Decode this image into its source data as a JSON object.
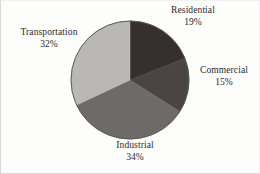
{
  "chart_data": {
    "type": "pie",
    "title": "",
    "subtitle": "",
    "xlabel": "",
    "ylabel": "",
    "legend_position": "none",
    "grid": false,
    "start_angle_deg": 0,
    "direction": "clockwise",
    "categories": [
      "Residential",
      "Commercial",
      "Industrial",
      "Transportation"
    ],
    "values": [
      19,
      15,
      34,
      32
    ],
    "value_unit": "%",
    "slices": [
      {
        "label": "Residential",
        "value": 19,
        "percent_text": "19%",
        "color": "#35302f",
        "start_deg": 0,
        "end_deg": 68.4,
        "label_position": "top-right"
      },
      {
        "label": "Commercial",
        "value": 15,
        "percent_text": "15%",
        "color": "#4a4543",
        "start_deg": 68.4,
        "end_deg": 122.4,
        "label_position": "right"
      },
      {
        "label": "Industrial",
        "value": 34,
        "percent_text": "34%",
        "color": "#6e6a68",
        "start_deg": 122.4,
        "end_deg": 244.8,
        "label_position": "bottom"
      },
      {
        "label": "Transportation",
        "value": 32,
        "percent_text": "32%",
        "color": "#b9b8b4",
        "start_deg": 244.8,
        "end_deg": 360,
        "label_position": "left"
      }
    ],
    "outline_color": "#5a5a5a",
    "background_color": "#fdfdfc",
    "text_color": "#2b2b2b"
  },
  "labels": {
    "residential": {
      "name": "Residential",
      "pct": "19%"
    },
    "commercial": {
      "name": "Commercial",
      "pct": "15%"
    },
    "industrial": {
      "name": "Industrial",
      "pct": "34%"
    },
    "transportation": {
      "name": "Transportation",
      "pct": "32%"
    }
  }
}
